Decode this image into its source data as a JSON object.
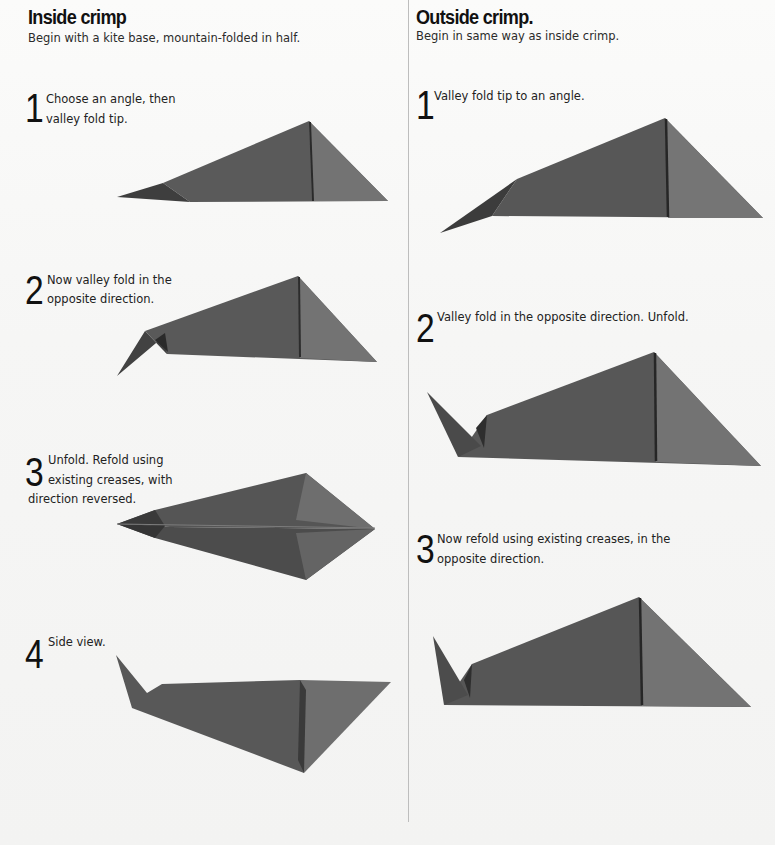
{
  "left_section": {
    "title": "Inside crimp",
    "subtitle": "Begin with a kite base, mountain-folded in half.",
    "steps": [
      {
        "number": "1",
        "line1": "Choose an angle, then",
        "line2": "valley fold tip."
      },
      {
        "number": "2",
        "line1": "Now valley fold in the",
        "line2": "opposite direction."
      },
      {
        "number": "3",
        "line1": "Unfold. Refold using",
        "line2": "existing creases, with",
        "line3": "direction reversed."
      },
      {
        "number": "4",
        "line1": "Side view."
      }
    ]
  },
  "right_section": {
    "title": "Outside crimp.",
    "subtitle": "Begin in same way as inside crimp.",
    "steps": [
      {
        "number": "1",
        "line1": "Valley fold tip to an angle."
      },
      {
        "number": "2",
        "line1": "Valley fold in the opposite direction. Unfold."
      },
      {
        "number": "3",
        "line1": "Now refold using existing creases, in the",
        "line2": "opposite direction."
      }
    ]
  },
  "colors": {
    "paper_dark": "#505050",
    "paper_mid": "#5e5e5e",
    "paper_light": "#727272",
    "background": "#f7f7f6",
    "divider": "#bdbdbd"
  }
}
